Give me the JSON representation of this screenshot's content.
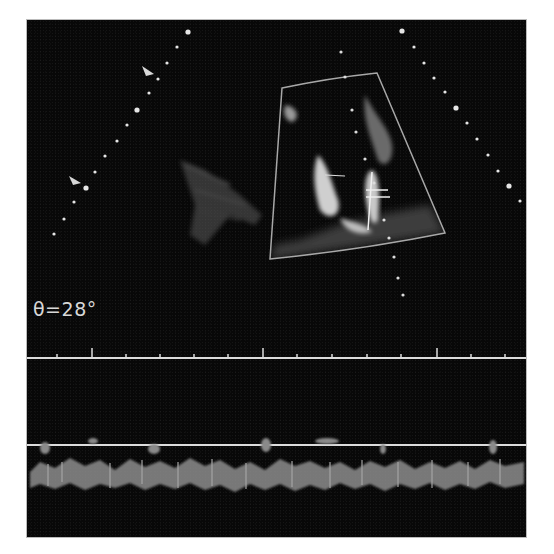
{
  "image": {
    "description": "Color Doppler echocardiography display (grayscale reproduction) with sector scan, depth markers and M-mode/spectral strips",
    "background_color": "#080808",
    "foreground_color": "#d8d8d8"
  },
  "scan": {
    "angle_label": "θ=28°",
    "sector_box": {
      "top_left": [
        282,
        88
      ],
      "top_right": [
        377,
        73
      ],
      "bottom_right": [
        445,
        233
      ],
      "bottom_left": [
        270,
        259
      ]
    },
    "markers": {
      "left_arrows": 2,
      "depth_dot_arcs": 2
    }
  },
  "timeline": {
    "tick_count": 14,
    "major_ticks": 3
  },
  "caption": {
    "text": "",
    "note": "caption text cut off at bottom edge"
  }
}
